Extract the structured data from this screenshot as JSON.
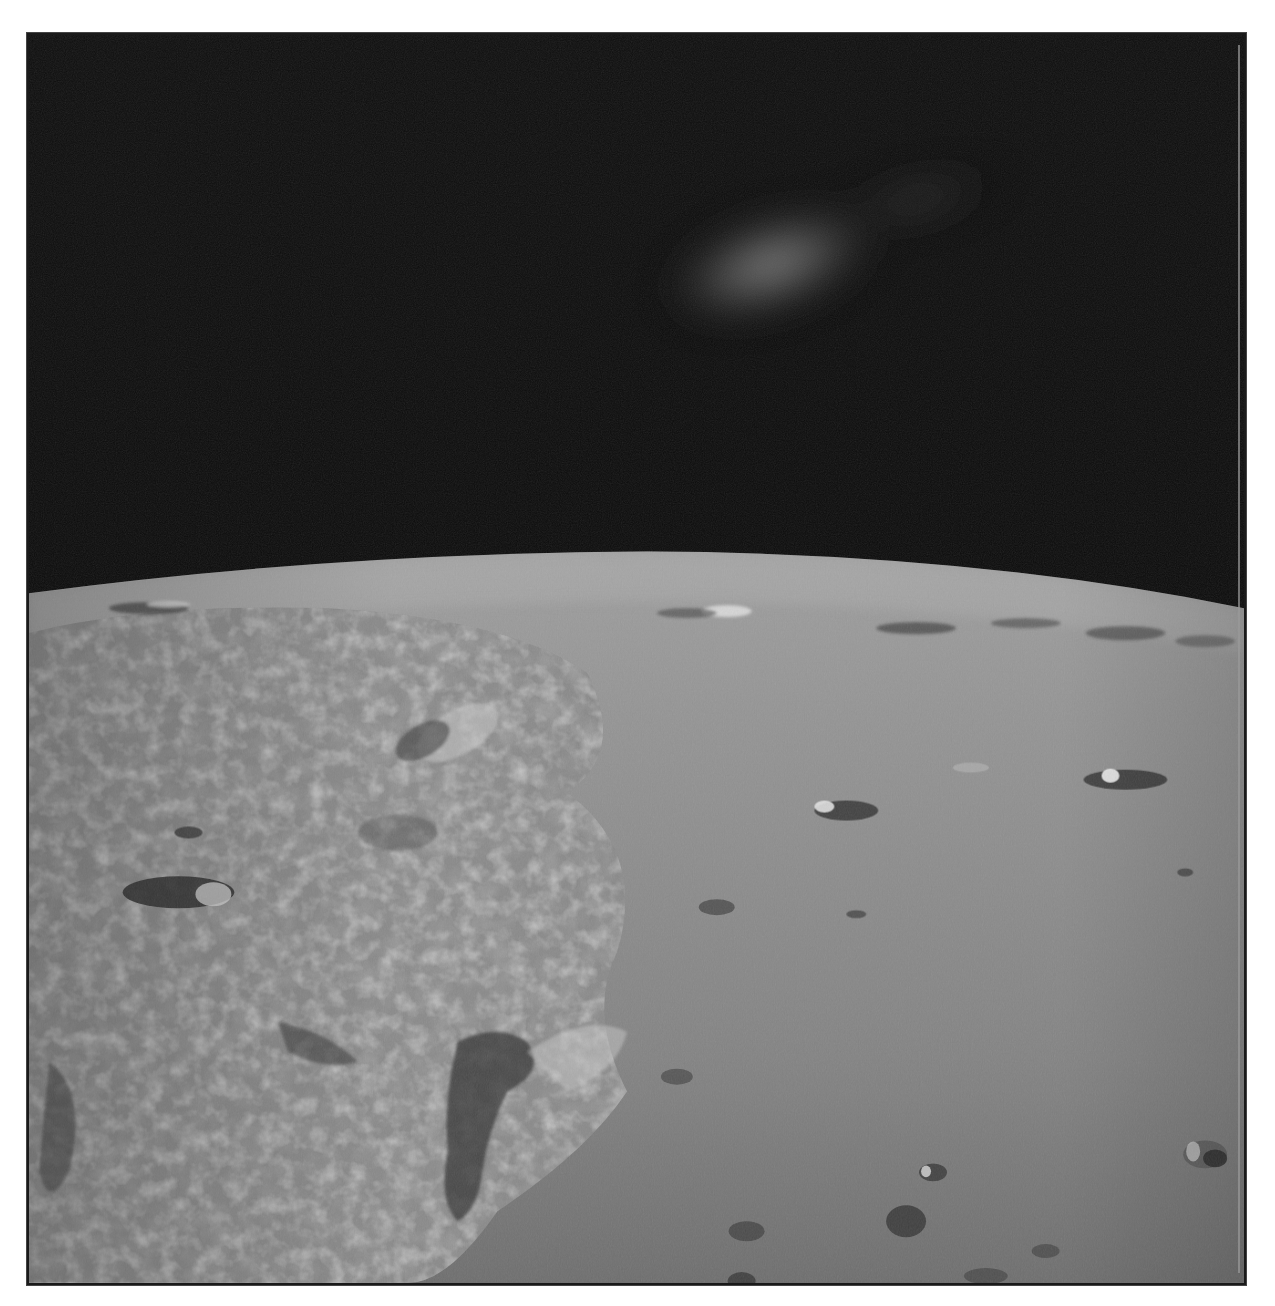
{
  "page": {
    "background_color": "#ffffff",
    "top_text_clipped": ""
  },
  "photo": {
    "subject": "Lunar surface seen from orbit with curved horizon against black space",
    "description": "Oblique view of lunar mare and highlands with scattered craters, rugged terrain on left, smooth plains on right, and a diffuse lens flare in the dark sky",
    "colors": {
      "sky": "#0b0b0b",
      "flare": "#8c8c8c",
      "surface_light": "#9e9e9e",
      "surface_mid": "#858585",
      "surface_dark": "#5a5a5a",
      "shadow": "#2e2e2e",
      "border": "#1a1a1a"
    },
    "features": [
      {
        "name": "lens-flare",
        "type": "glow"
      },
      {
        "name": "horizon",
        "type": "curve"
      },
      {
        "name": "rugged-highlands",
        "type": "terrain"
      },
      {
        "name": "smooth-mare",
        "type": "terrain"
      },
      {
        "name": "craters",
        "type": "craters"
      }
    ]
  }
}
